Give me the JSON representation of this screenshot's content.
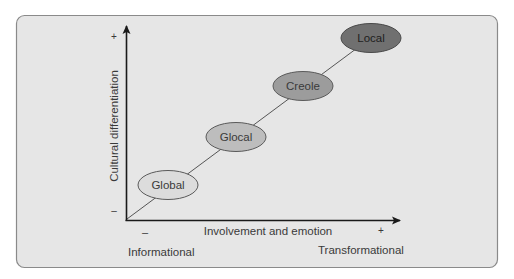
{
  "diagram": {
    "type": "positioning-diagram",
    "y_axis": {
      "label": "Cultural differentiation",
      "plus": "+",
      "minus": "–"
    },
    "x_axis": {
      "label": "Involvement and emotion",
      "plus": "+",
      "minus": "–",
      "low_end_label": "Informational",
      "high_end_label": "Transformational"
    },
    "nodes": [
      {
        "label": "Global",
        "fill": "#dcdcdc"
      },
      {
        "label": "Glocal",
        "fill": "#bdbdbd"
      },
      {
        "label": "Creole",
        "fill": "#9c9c9c"
      },
      {
        "label": "Local",
        "fill": "#707070"
      }
    ],
    "colors": {
      "panel_fill": "#e6e6e6",
      "panel_border": "#8a8a8a",
      "axis": "#1a1a1a",
      "connector": "#555555"
    }
  }
}
